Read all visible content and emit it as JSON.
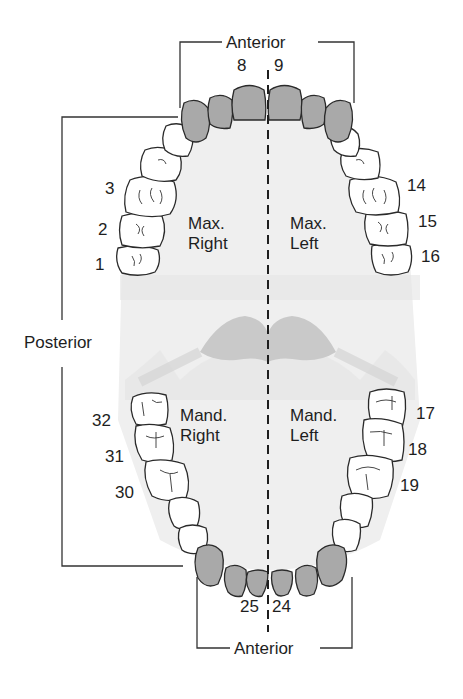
{
  "diagram": {
    "labels": {
      "anterior_top": "Anterior",
      "anterior_bottom": "Anterior",
      "posterior": "Posterior"
    },
    "quadrants": {
      "max_right": {
        "line1": "Max.",
        "line2": "Right"
      },
      "max_left": {
        "line1": "Max.",
        "line2": "Left"
      },
      "mand_right": {
        "line1": "Mand.",
        "line2": "Right"
      },
      "mand_left": {
        "line1": "Mand.",
        "line2": "Left"
      }
    },
    "tooth_numbers": {
      "t1": "1",
      "t2": "2",
      "t3": "3",
      "t8": "8",
      "t9": "9",
      "t14": "14",
      "t15": "15",
      "t16": "16",
      "t17": "17",
      "t18": "18",
      "t19": "19",
      "t24": "24",
      "t25": "25",
      "t30": "30",
      "t31": "31",
      "t32": "32"
    },
    "colors": {
      "anterior_tooth_fill": "#a9a9a9",
      "posterior_tooth_fill": "#ffffff",
      "outline": "#2a2a2a",
      "palate_fill": "#ececec",
      "tongue_fill": "#c9c9c9",
      "text": "#1e1e1e"
    }
  }
}
